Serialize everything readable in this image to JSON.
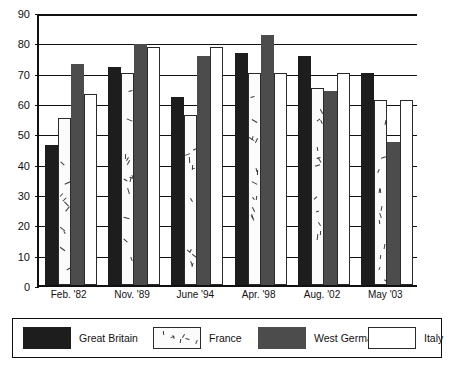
{
  "chart_data": {
    "type": "bar",
    "title": "",
    "subtitle": "",
    "xlabel": "",
    "ylabel": "",
    "ylim": [
      0,
      90
    ],
    "ytick_step": 10,
    "yticks": [
      0,
      10,
      20,
      30,
      40,
      50,
      60,
      70,
      80,
      90
    ],
    "ytick_labels": [
      "0",
      "10",
      "20",
      "30",
      "40",
      "50",
      "60",
      "70",
      "80",
      "90"
    ],
    "grid": true,
    "grid_axis": "y",
    "legend_position": "bottom",
    "categories": [
      "Feb. '82",
      "Nov. '89",
      "June '94",
      "Apr. '98",
      "Aug. '02",
      "May '03"
    ],
    "series": [
      {
        "name": "Great Britain",
        "color": "#1d1d1d",
        "fill": "solid-black",
        "values": [
          46,
          72,
          62,
          76.5,
          75.5,
          70
        ]
      },
      {
        "name": "France",
        "color": "#fbfbfb",
        "fill": "speckled-white",
        "values": [
          55,
          70,
          56,
          70,
          65,
          61
        ]
      },
      {
        "name": "West Germany",
        "color": "#4c4c4c",
        "fill": "solid-gray",
        "values": [
          73,
          79.5,
          75.5,
          82.5,
          64,
          47
        ]
      },
      {
        "name": "Italy",
        "color": "#ffffff",
        "fill": "outline-white",
        "values": [
          63,
          78.5,
          78.5,
          70,
          70,
          61
        ]
      }
    ]
  },
  "legend": {
    "items": [
      {
        "label": "Great Britain",
        "swatch": "s-gb"
      },
      {
        "label": "France",
        "swatch": "s-fr"
      },
      {
        "label": "West Germany",
        "swatch": "s-wg"
      },
      {
        "label": "Italy",
        "swatch": "s-it"
      }
    ]
  }
}
